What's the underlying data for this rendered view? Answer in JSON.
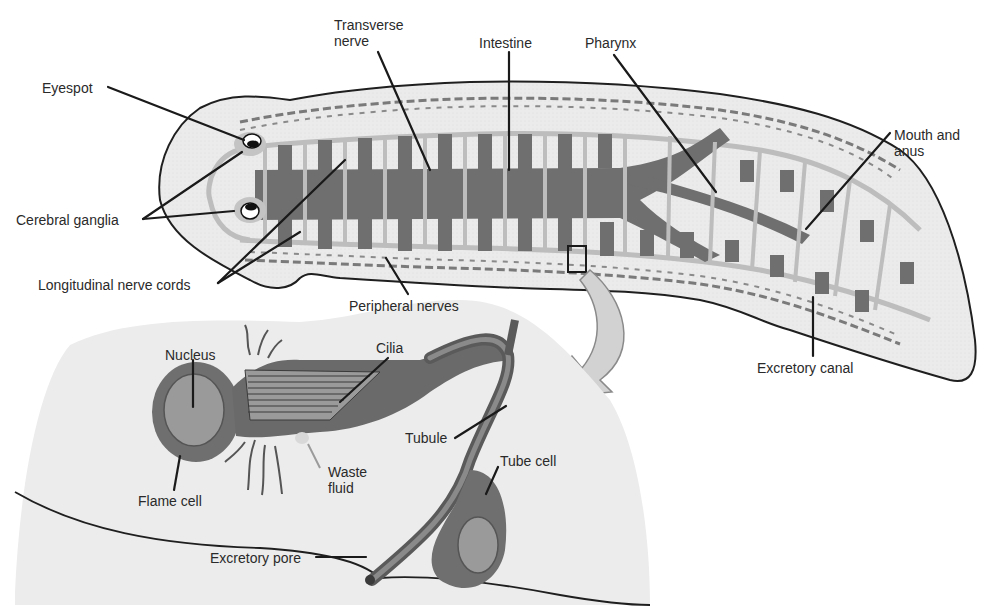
{
  "diagram": {
    "colors": {
      "body_fill": "#ebebeb",
      "outline": "#1f1f1f",
      "intestine": "#6f6f6f",
      "nerve": "#bdbdbd",
      "peripheral_nerve": "#7a7a7a",
      "inset_fill": "#ececec",
      "cell_dark": "#6a6a6a",
      "cell_mid": "#9a9a9a",
      "arrow_fill": "#d2d2d2",
      "leader": "#1a1a1a"
    },
    "labels": {
      "eyespot": "Eyespot",
      "cerebral_ganglia": "Cerebral ganglia",
      "longitudinal_nerve_cords": "Longitudinal nerve cords",
      "transverse_nerve_line1": "Transverse",
      "transverse_nerve_line2": "nerve",
      "intestine": "Intestine",
      "pharynx": "Pharynx",
      "mouth_and_anus_line1": "Mouth and",
      "mouth_and_anus_line2": "anus",
      "peripheral_nerves": "Peripheral nerves",
      "excretory_canal": "Excretory canal",
      "nucleus": "Nucleus",
      "cilia": "Cilia",
      "tubule": "Tubule",
      "tube_cell": "Tube cell",
      "flame_cell": "Flame cell",
      "waste_fluid_line1": "Waste",
      "waste_fluid_line2": "fluid",
      "excretory_pore": "Excretory pore"
    }
  }
}
